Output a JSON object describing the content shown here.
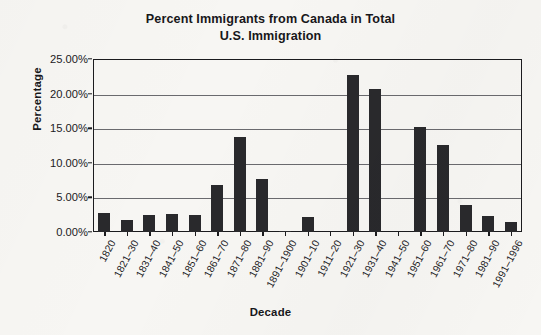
{
  "chart_data": {
    "type": "bar",
    "title": "Percent Immigrants from Canada in Total U.S. Immigration",
    "title_line1": "Percent Immigrants from Canada in Total",
    "title_line2": "U.S. Immigration",
    "xlabel": "Decade",
    "ylabel": "Percentage",
    "categories": [
      "1820",
      "1821–30",
      "1831–40",
      "1841–50",
      "1851–60",
      "1861–70",
      "1871–80",
      "1881–90",
      "1891–1900",
      "1901–10",
      "1911–20",
      "1921–30",
      "1931–40",
      "1941–50",
      "1951–60",
      "1961–70",
      "1971–80",
      "1981–90",
      "1991–1996"
    ],
    "values": [
      2.7,
      1.8,
      2.4,
      2.6,
      2.5,
      6.8,
      13.8,
      7.6,
      0.2,
      2.2,
      0.0,
      22.7,
      20.7,
      0.0,
      15.2,
      12.6,
      3.9,
      2.3,
      1.5
    ],
    "ylim": [
      0,
      25
    ],
    "ytick_values": [
      0,
      5,
      10,
      15,
      20,
      25
    ],
    "ytick_labels": [
      "0.00%",
      "5.00%",
      "10.00%",
      "15.00%",
      "20.00%",
      "25.00%"
    ],
    "grid": true,
    "legend": null,
    "bar_color": "#29292c",
    "axis_color": "#1b1b1e",
    "grid_color": "#6a6a6e",
    "background_color": "#f7f6f3"
  }
}
